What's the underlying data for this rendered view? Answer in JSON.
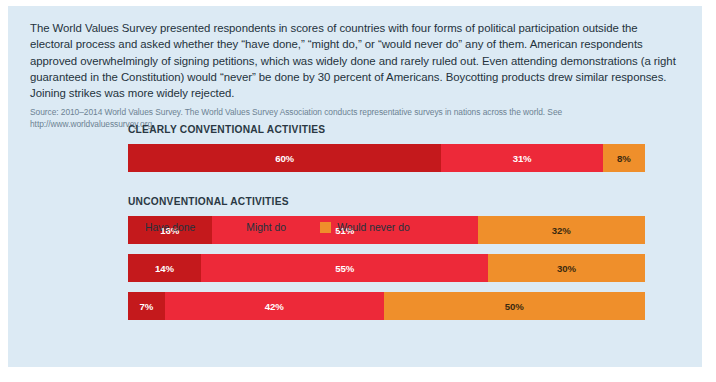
{
  "figure": {
    "background_color": "#dceaf4",
    "intro_paragraph": "The World Values Survey presented respondents in scores of countries with four forms of political participation outside the electoral process and asked whether they “have done,” “might do,” or “would never do” any of them. American respondents approved overwhelmingly of signing petitions, which was widely done and rarely ruled out. Even attending demonstrations (a right guaranteed in the Constitution) would “never” be done by 30 percent of Americans. Boycotting products drew similar responses. Joining strikes was more widely rejected.",
    "source_note": "Source: 2010–2014 World Values Survey. The World Values Survey Association conducts representative surveys in nations across the world. See http://www.worldvaluessurvey.org."
  },
  "chart_data": {
    "type": "bar",
    "orientation": "horizontal",
    "stacked": true,
    "stack_total": 100,
    "value_suffix": "%",
    "title": "",
    "xlabel": "",
    "ylabel": "",
    "xlim": [
      0,
      100
    ],
    "grid": false,
    "legend_position": "bottom-left",
    "series": [
      {
        "name": "Have done",
        "color": "#c4191c",
        "label_color": "#ffffff",
        "values": [
          60,
          16,
          14,
          7
        ]
      },
      {
        "name": "Might do",
        "color": "#ed2939",
        "label_color": "#ffffff",
        "values": [
          31,
          51,
          55,
          42
        ]
      },
      {
        "name": "Would never do",
        "color": "#ef8f2b",
        "label_color": "#3a2a10",
        "values": [
          8,
          32,
          30,
          50
        ]
      }
    ],
    "categories": [
      "Signing petitions",
      "Joining in boycotts",
      "Attending peaceful demonstrations",
      "Joining strikes"
    ],
    "sections": [
      {
        "heading": "CLEARLY CONVENTIONAL ACTIVITIES",
        "rows": [
          {
            "label": "Signing petitions",
            "segments": [
              {
                "series": "Have done",
                "value": 60,
                "value_label": "60%",
                "color": "#c4191c",
                "label_color": "#ffffff"
              },
              {
                "series": "Might do",
                "value": 31,
                "value_label": "31%",
                "color": "#ed2939",
                "label_color": "#ffffff"
              },
              {
                "series": "Would never do",
                "value": 8,
                "value_label": "8%",
                "color": "#ef8f2b",
                "label_color": "#3a2a10"
              }
            ]
          }
        ]
      },
      {
        "heading": "UNCONVENTIONAL ACTIVITIES",
        "rows": [
          {
            "label": "Joining in boycotts",
            "segments": [
              {
                "series": "Have done",
                "value": 16,
                "value_label": "16%",
                "color": "#c4191c",
                "label_color": "#ffffff"
              },
              {
                "series": "Might do",
                "value": 51,
                "value_label": "51%",
                "color": "#ed2939",
                "label_color": "#ffffff"
              },
              {
                "series": "Would never do",
                "value": 32,
                "value_label": "32%",
                "color": "#ef8f2b",
                "label_color": "#3a2a10"
              }
            ]
          },
          {
            "label": "Attending peaceful\ndemonstrations",
            "segments": [
              {
                "series": "Have done",
                "value": 14,
                "value_label": "14%",
                "color": "#c4191c",
                "label_color": "#ffffff"
              },
              {
                "series": "Might do",
                "value": 55,
                "value_label": "55%",
                "color": "#ed2939",
                "label_color": "#ffffff"
              },
              {
                "series": "Would never do",
                "value": 30,
                "value_label": "30%",
                "color": "#ef8f2b",
                "label_color": "#3a2a10"
              }
            ]
          },
          {
            "label": "Joining strikes",
            "segments": [
              {
                "series": "Have done",
                "value": 7,
                "value_label": "7%",
                "color": "#c4191c",
                "label_color": "#ffffff"
              },
              {
                "series": "Might do",
                "value": 42,
                "value_label": "42%",
                "color": "#ed2939",
                "label_color": "#ffffff"
              },
              {
                "series": "Would never do",
                "value": 50,
                "value_label": "50%",
                "color": "#ef8f2b",
                "label_color": "#3a2a10"
              }
            ]
          }
        ]
      }
    ],
    "legend": [
      {
        "label": "Have done",
        "color": "#c4191c"
      },
      {
        "label": "Might do",
        "color": "#ed2939"
      },
      {
        "label": "Would never do",
        "color": "#ef8f2b"
      }
    ]
  }
}
